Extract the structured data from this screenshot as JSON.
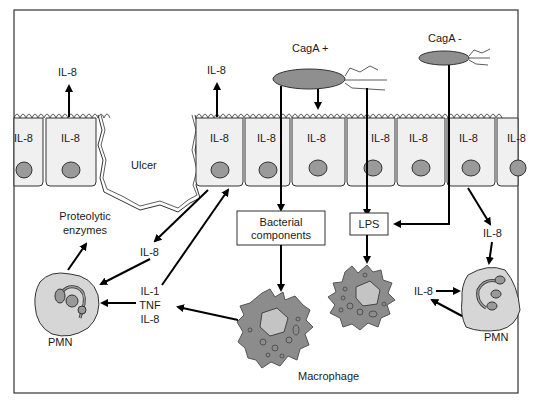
{
  "figure": {
    "frame_color": "#333333",
    "colors": {
      "cell_fill": "#f0f0f0",
      "nucleus": "#9a9a9a",
      "bacterium": "#8f8f8f",
      "macrophage": "#8c8c8c",
      "pmn": "#d6d6d6"
    }
  },
  "bacteria": {
    "cag_positive": "CagA +",
    "cag_negative": "CagA -"
  },
  "epithelium": {
    "cell_label": "IL-8",
    "ulcer_label": "Ulcer",
    "secreted_left": "IL-8",
    "secreted_right": "IL-8"
  },
  "boxes": {
    "bacterial_components_line1": "Bacterial",
    "bacterial_components_line2": "components",
    "lps": "LPS"
  },
  "left_side": {
    "proteolytic_line1": "Proteolytic",
    "proteolytic_line2": "enzymes",
    "il8": "IL-8",
    "cytokines": [
      "IL-1",
      "TNF",
      "IL-8"
    ],
    "pmn_label": "PMN"
  },
  "center": {
    "macrophage_label": "Macrophage"
  },
  "right_side": {
    "il8_from_epithelium": "IL-8",
    "il8_loop": "IL-8",
    "pmn_label": "PMN"
  }
}
